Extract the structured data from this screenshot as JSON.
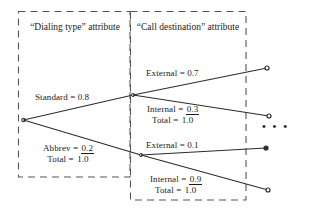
{
  "diagram": {
    "type": "probability-tree",
    "title_absent": true,
    "boxes": [
      {
        "id": "dialing-type",
        "label_lines": [
          "“Dialing",
          "type”",
          "attribute"
        ],
        "x": 75,
        "y": 11,
        "w": 112,
        "h": 166,
        "style": "dashed"
      },
      {
        "id": "call-destination",
        "label_lines": [
          "“Call",
          "destination”",
          "attribute"
        ],
        "x": 188,
        "y": 11,
        "w": 116,
        "h": 189,
        "style": "dashed"
      }
    ],
    "branch_labels": {
      "standard": {
        "text": "Standard = 0.8",
        "value": "0.8",
        "name": "Standard"
      },
      "abbrev": {
        "name": "Abbrev",
        "value": "0.2",
        "total_label": "Total",
        "total": "1.0"
      },
      "external_top": {
        "text": "External = 0.7",
        "name": "External",
        "value": "0.7"
      },
      "internal_top": {
        "name": "Internal",
        "value": "0.3",
        "total_label": "Total",
        "total": "1.0"
      },
      "external_bottom": {
        "text": "External =  0.1",
        "name": "External",
        "value": "0.1"
      },
      "internal_bottom": {
        "name": "Internal",
        "value": "0.9",
        "total_label": "Total",
        "total": "1.0"
      }
    },
    "ellipsis": "• • •",
    "colors": {
      "line": "#2b2b2b",
      "dash": "#4d4d4d",
      "text": "#1a1a1a",
      "background": "#ffffff"
    }
  }
}
